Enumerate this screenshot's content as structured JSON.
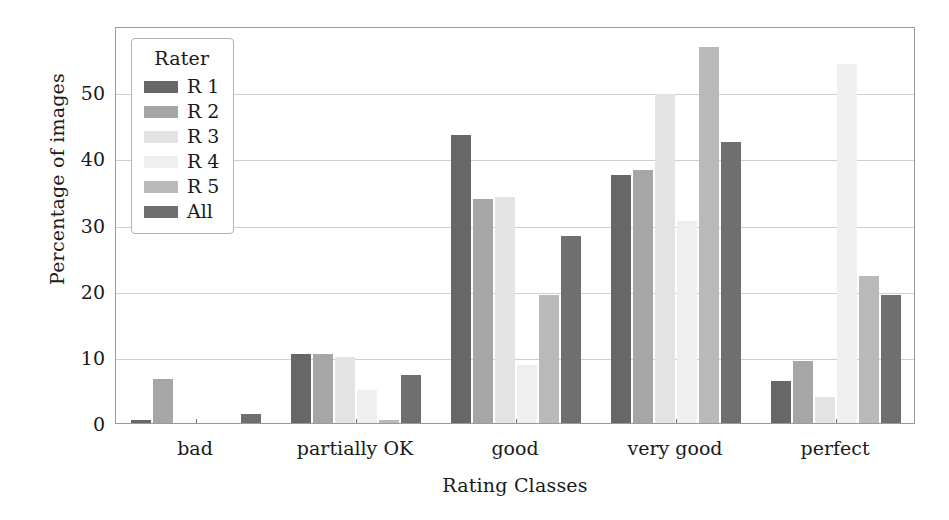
{
  "chart_data": {
    "type": "bar",
    "title": "",
    "xlabel": "Rating Classes",
    "ylabel": "Percentage of images",
    "categories": [
      "bad",
      "partially OK",
      "good",
      "very good",
      "perfect"
    ],
    "ylim": [
      0,
      60
    ],
    "yticks": [
      0,
      10,
      20,
      30,
      40,
      50
    ],
    "ytick_labels": [
      "0",
      "10",
      "20",
      "30",
      "40",
      "50"
    ],
    "grid": "horizontal",
    "legend_position": "upper-left-inside",
    "legend_title": "Rater",
    "series": [
      {
        "name": "R 1",
        "color": "#676767",
        "values": [
          0.4,
          10.5,
          43.5,
          37.5,
          6.3
        ]
      },
      {
        "name": "R 2",
        "color": "#a6a6a6",
        "values": [
          6.7,
          10.4,
          33.8,
          38.2,
          9.4
        ]
      },
      {
        "name": "R 3",
        "color": "#e3e3e3",
        "values": [
          0.0,
          10.0,
          34.2,
          49.7,
          3.9
        ]
      },
      {
        "name": "R 4",
        "color": "#efefef",
        "values": [
          0.0,
          5.0,
          8.7,
          30.5,
          54.2
        ]
      },
      {
        "name": "R 5",
        "color": "#b9b9b9",
        "values": [
          0.0,
          0.4,
          19.4,
          56.8,
          22.2
        ]
      },
      {
        "name": "All",
        "color": "#6f6f6f",
        "values": [
          1.3,
          7.2,
          28.2,
          42.5,
          19.3
        ]
      }
    ]
  },
  "axis": {
    "ylabel": "Percentage of images",
    "xlabel": "Rating Classes"
  },
  "legend": {
    "title": "Rater"
  }
}
